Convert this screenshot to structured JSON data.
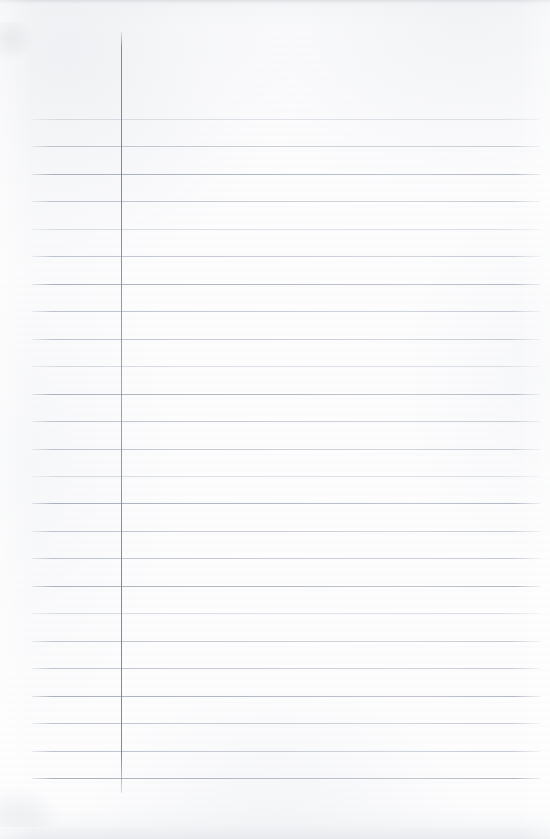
{
  "document": {
    "kind": "scanned-ruled-notebook-page",
    "title": "Blank ruled notebook page",
    "content_text": "",
    "page_width": 550,
    "page_height": 839,
    "colors": {
      "paper": "#fcfcfd",
      "paper_shadow": "#f2f3f5",
      "rule_line": "#bcc2cd",
      "rule_line_strong": "#aab0bd",
      "rule_line_faint": "#ced2da",
      "margin_line": "#86888e",
      "scan_edge": "#d6d8dd"
    }
  },
  "ruling": {
    "horizontal_label": "horizontal rule line",
    "vertical_label": "vertical margin rule line",
    "line_count": 25,
    "first_line_y": 119,
    "line_spacing": 27.46,
    "line_start_x": 32,
    "line_end_x": 540,
    "line_weights": [
      "faint",
      "normal",
      "strong",
      "normal",
      "faint",
      "normal",
      "strong",
      "normal",
      "normal",
      "faint",
      "strong",
      "normal",
      "normal",
      "faint",
      "strong",
      "normal",
      "normal",
      "strong",
      "faint",
      "normal",
      "normal",
      "strong",
      "normal",
      "normal",
      "strong"
    ],
    "margin_line_x": 121,
    "margin_line_top_y": 32,
    "margin_line_bottom_y": 793
  }
}
